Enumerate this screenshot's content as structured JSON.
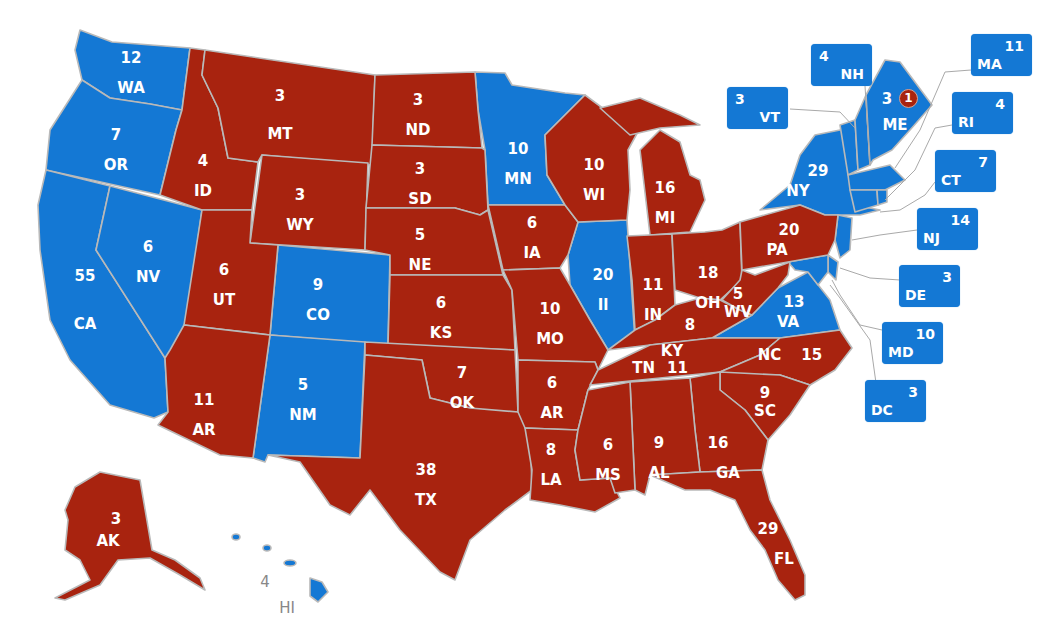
{
  "map": {
    "colors": {
      "republican": "#a8230f",
      "democrat": "#1478d4",
      "border": "#b9b9b9",
      "background": "#ffffff",
      "hawaii_label": "#888888"
    },
    "states": [
      {
        "abbr": "WA",
        "ev": "12",
        "party": "D"
      },
      {
        "abbr": "OR",
        "ev": "7",
        "party": "D"
      },
      {
        "abbr": "CA",
        "ev": "55",
        "party": "D"
      },
      {
        "abbr": "NV",
        "ev": "6",
        "party": "D"
      },
      {
        "abbr": "ID",
        "ev": "4",
        "party": "R"
      },
      {
        "abbr": "MT",
        "ev": "3",
        "party": "R"
      },
      {
        "abbr": "WY",
        "ev": "3",
        "party": "R"
      },
      {
        "abbr": "UT",
        "ev": "6",
        "party": "R"
      },
      {
        "abbr": "CO",
        "ev": "9",
        "party": "D"
      },
      {
        "abbr": "AR",
        "ev": "11",
        "party": "R",
        "note": "Arizona (labeled AR on map)"
      },
      {
        "abbr": "NM",
        "ev": "5",
        "party": "D"
      },
      {
        "abbr": "ND",
        "ev": "3",
        "party": "R"
      },
      {
        "abbr": "SD",
        "ev": "3",
        "party": "R"
      },
      {
        "abbr": "NE",
        "ev": "5",
        "party": "R"
      },
      {
        "abbr": "KS",
        "ev": "6",
        "party": "R"
      },
      {
        "abbr": "OK",
        "ev": "7",
        "party": "R"
      },
      {
        "abbr": "TX",
        "ev": "38",
        "party": "R"
      },
      {
        "abbr": "MN",
        "ev": "10",
        "party": "D"
      },
      {
        "abbr": "IA",
        "ev": "6",
        "party": "R"
      },
      {
        "abbr": "MO",
        "ev": "10",
        "party": "R"
      },
      {
        "abbr": "AR",
        "ev": "6",
        "party": "R"
      },
      {
        "abbr": "LA",
        "ev": "8",
        "party": "R"
      },
      {
        "abbr": "WI",
        "ev": "10",
        "party": "R"
      },
      {
        "abbr": "Il",
        "ev": "20",
        "party": "D"
      },
      {
        "abbr": "MI",
        "ev": "16",
        "party": "R"
      },
      {
        "abbr": "IN",
        "ev": "11",
        "party": "R"
      },
      {
        "abbr": "OH",
        "ev": "18",
        "party": "R"
      },
      {
        "abbr": "KY",
        "ev": "8",
        "party": "R"
      },
      {
        "abbr": "TN",
        "ev": "11",
        "party": "R"
      },
      {
        "abbr": "MS",
        "ev": "6",
        "party": "R"
      },
      {
        "abbr": "AL",
        "ev": "9",
        "party": "R"
      },
      {
        "abbr": "GA",
        "ev": "16",
        "party": "R"
      },
      {
        "abbr": "FL",
        "ev": "29",
        "party": "R"
      },
      {
        "abbr": "SC",
        "ev": "9",
        "party": "R"
      },
      {
        "abbr": "NC",
        "ev": "15",
        "party": "R"
      },
      {
        "abbr": "VA",
        "ev": "13",
        "party": "D"
      },
      {
        "abbr": "WV",
        "ev": "5",
        "party": "R"
      },
      {
        "abbr": "PA",
        "ev": "20",
        "party": "R"
      },
      {
        "abbr": "NY",
        "ev": "29",
        "party": "D"
      },
      {
        "abbr": "ME",
        "ev": "3",
        "party": "D",
        "split_ev": "1",
        "split_party": "R"
      },
      {
        "abbr": "AK",
        "ev": "3",
        "party": "R"
      },
      {
        "abbr": "HI",
        "ev": "4",
        "party": "D"
      }
    ],
    "callouts": [
      {
        "abbr": "NH",
        "ev": "4",
        "party": "D"
      },
      {
        "abbr": "VT",
        "ev": "3",
        "party": "D"
      },
      {
        "abbr": "MA",
        "ev": "11",
        "party": "D"
      },
      {
        "abbr": "RI",
        "ev": "4",
        "party": "D"
      },
      {
        "abbr": "CT",
        "ev": "7",
        "party": "D"
      },
      {
        "abbr": "NJ",
        "ev": "14",
        "party": "D"
      },
      {
        "abbr": "DE",
        "ev": "3",
        "party": "D"
      },
      {
        "abbr": "MD",
        "ev": "10",
        "party": "D"
      },
      {
        "abbr": "DC",
        "ev": "3",
        "party": "D"
      }
    ]
  }
}
